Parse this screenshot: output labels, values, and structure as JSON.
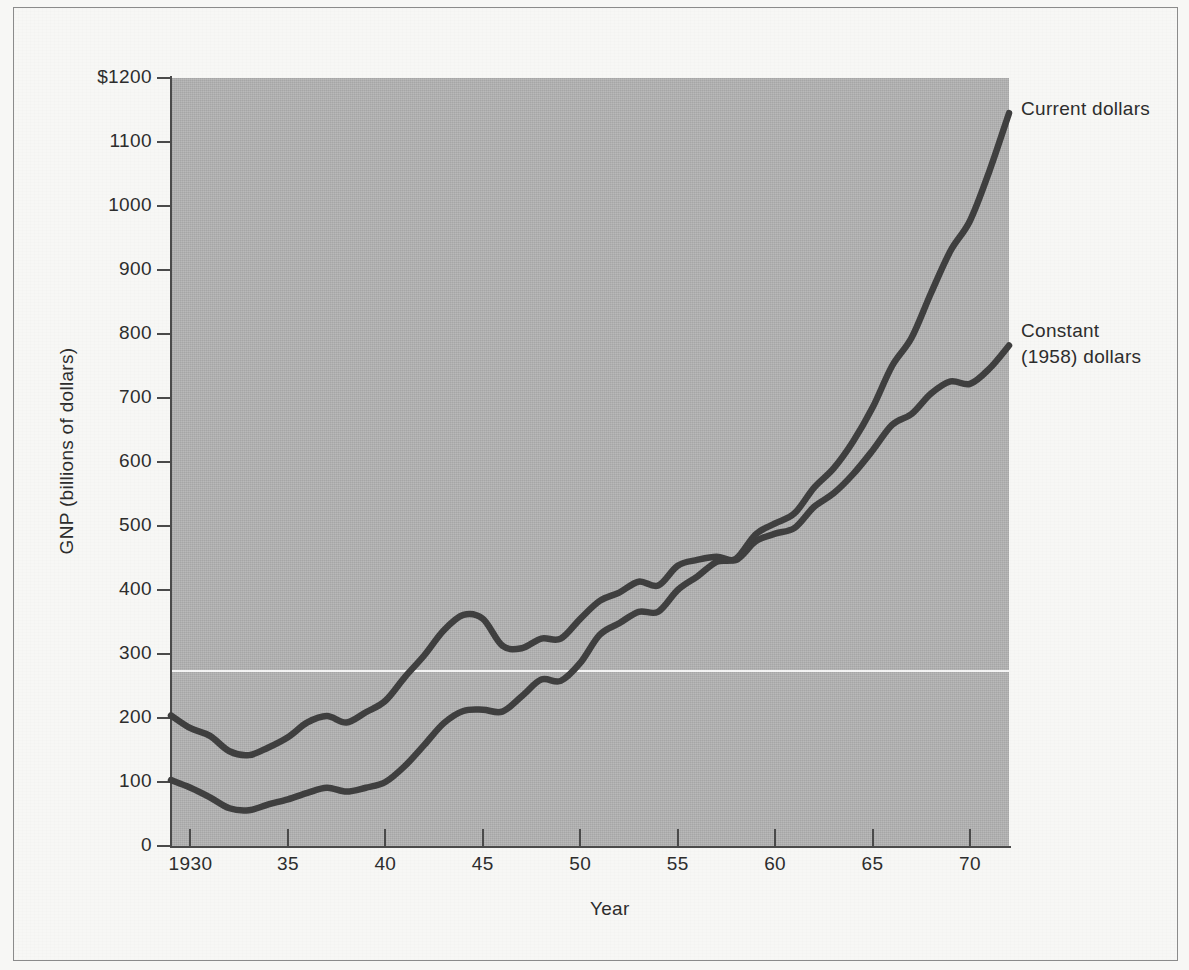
{
  "figure": {
    "background_color": "#f7f7f5",
    "plot_background_color": "#b2b2b2",
    "line_color": "#3f3f3f"
  },
  "chart_data": {
    "type": "line",
    "title": "",
    "xlabel": "Year",
    "ylabel": "GNP (billions of dollars)",
    "xlim": [
      1929,
      1972
    ],
    "ylim": [
      0,
      1200
    ],
    "grid": false,
    "legend_position": "right-of-plot (direct labels at line ends)",
    "y_ticks": [
      0,
      100,
      200,
      300,
      400,
      500,
      600,
      700,
      800,
      900,
      1000,
      1100,
      1200
    ],
    "y_tick_labels": [
      "0",
      "100",
      "200",
      "300",
      "400",
      "500",
      "600",
      "700",
      "800",
      "900",
      "1000",
      "1100",
      "$1200"
    ],
    "x_ticks": [
      1930,
      1935,
      1940,
      1945,
      1950,
      1955,
      1960,
      1965,
      1970
    ],
    "x_tick_labels": [
      "1930",
      "35",
      "40",
      "45",
      "50",
      "55",
      "60",
      "65",
      "70"
    ],
    "x": [
      1929,
      1930,
      1931,
      1932,
      1933,
      1934,
      1935,
      1936,
      1937,
      1938,
      1939,
      1940,
      1941,
      1942,
      1943,
      1944,
      1945,
      1946,
      1947,
      1948,
      1949,
      1950,
      1951,
      1952,
      1953,
      1954,
      1955,
      1956,
      1957,
      1958,
      1959,
      1960,
      1961,
      1962,
      1963,
      1964,
      1965,
      1966,
      1967,
      1968,
      1969,
      1970,
      1971,
      1972
    ],
    "series": [
      {
        "name": "Current dollars",
        "label": "Current dollars",
        "label_lines": [
          "Current dollars"
        ],
        "values": [
          103,
          91,
          76,
          59,
          56,
          65,
          73,
          83,
          91,
          85,
          91,
          100,
          125,
          158,
          192,
          211,
          213,
          210,
          234,
          260,
          258,
          286,
          330,
          348,
          366,
          366,
          400,
          421,
          444,
          449,
          487,
          504,
          520,
          560,
          590,
          632,
          685,
          750,
          794,
          864,
          930,
          977,
          1055,
          1145
        ],
        "units": "billions of dollars"
      },
      {
        "name": "Constant (1958) dollars",
        "label": "Constant (1958) dollars",
        "label_lines": [
          "Constant",
          "(1958) dollars"
        ],
        "values": [
          204,
          184,
          172,
          148,
          142,
          154,
          170,
          193,
          203,
          193,
          209,
          227,
          264,
          298,
          337,
          361,
          355,
          313,
          309,
          324,
          324,
          355,
          383,
          396,
          413,
          407,
          438,
          447,
          452,
          447,
          476,
          488,
          497,
          530,
          551,
          581,
          618,
          658,
          675,
          707,
          726,
          722,
          746,
          782
        ],
        "units": "billions of 1958 dollars"
      }
    ]
  },
  "axis": {
    "ylabel_text": "GNP (billions of dollars)",
    "xlabel_text": "Year"
  }
}
